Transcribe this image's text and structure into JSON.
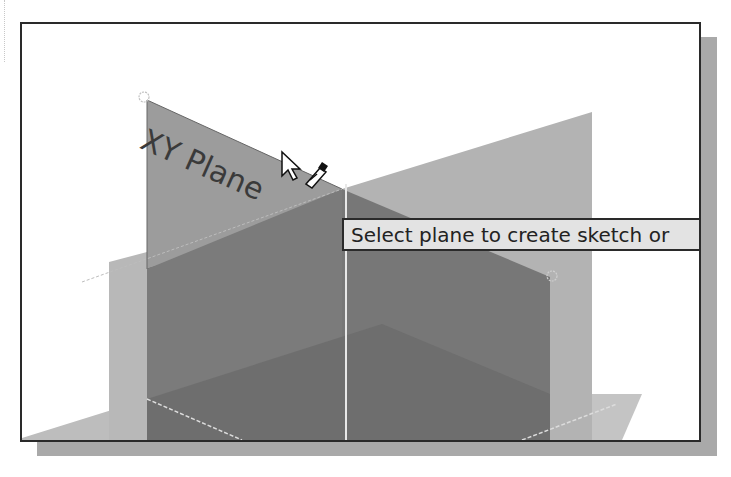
{
  "viewport": {
    "planes": [
      {
        "name": "XY Plane",
        "state": "highlighted"
      },
      {
        "name": "YZ Plane",
        "state": "default"
      },
      {
        "name": "XZ Plane",
        "state": "default"
      }
    ],
    "plane_label": "XY Plane",
    "tooltip": "Select plane to create sketch or",
    "cursor": {
      "icon": "arrow-cursor-with-sketch-pencil-icon"
    }
  },
  "colors": {
    "frame_border": "#2a2a2a",
    "shadow": "#a9a9a9",
    "plane_light": "#b9b9b9",
    "plane_medium": "#9a9a9a",
    "plane_dark": "#7a7a7a",
    "plane_darkest": "#6e6e6e",
    "tooltip_bg": "#e3e3e3"
  }
}
